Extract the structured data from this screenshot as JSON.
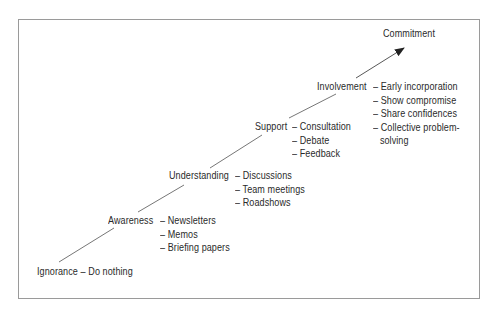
{
  "diagram": {
    "goal": "Commitment",
    "stages": [
      {
        "name": "Ignorance",
        "actions": [
          "Do nothing"
        ]
      },
      {
        "name": "Awareness",
        "actions": [
          "Newsletters",
          "Memos",
          "Briefing papers"
        ]
      },
      {
        "name": "Understanding",
        "actions": [
          "Discussions",
          "Team meetings",
          "Roadshows"
        ]
      },
      {
        "name": "Support",
        "actions": [
          "Consultation",
          "Debate",
          "Feedback"
        ]
      },
      {
        "name": "Involvement",
        "actions": [
          "Early incorporation",
          "Show compromise",
          "Share confidences",
          "Collective problem-",
          "solving"
        ]
      }
    ],
    "dash": "–",
    "line_color": "#555555"
  }
}
